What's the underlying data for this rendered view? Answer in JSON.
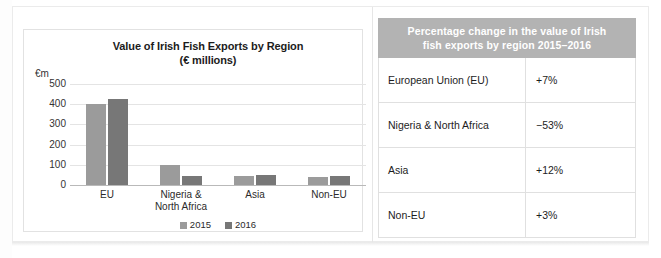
{
  "chart_data": {
    "type": "bar",
    "title": "Value of Irish Fish Exports by Region",
    "subtitle": "(€ millions)",
    "unit_label": "€m",
    "xlabel": "",
    "ylabel": "",
    "ylim": [
      0,
      500
    ],
    "ytick_values": [
      0,
      100,
      200,
      300,
      400,
      500
    ],
    "ytick_labels": [
      "0",
      "100",
      "200",
      "300",
      "400",
      "500"
    ],
    "grid": true,
    "legend_position": "bottom",
    "categories": [
      "EU",
      "Nigeria &\nNorth Africa",
      "Asia",
      "Non-EU"
    ],
    "category_labels": [
      {
        "line1": "EU",
        "line2": ""
      },
      {
        "line1": "Nigeria &",
        "line2": "North Africa"
      },
      {
        "line1": "Asia",
        "line2": ""
      },
      {
        "line1": "Non-EU",
        "line2": ""
      }
    ],
    "series": [
      {
        "name": "2015",
        "color": "#9b9b9b",
        "values": [
          400,
          100,
          47,
          42
        ]
      },
      {
        "name": "2016",
        "color": "#777777",
        "values": [
          428,
          45,
          48,
          44
        ]
      }
    ]
  },
  "table": {
    "header": {
      "line1": "Percentage change in the value of Irish",
      "line2": "fish exports by region 2015–2016",
      "background": "#b3b3b3",
      "text_color": "#ffffff"
    },
    "rows": [
      {
        "region": "European Union (EU)",
        "change": "+7%"
      },
      {
        "region": "Nigeria & North Africa",
        "change": "−53%"
      },
      {
        "region": "Asia",
        "change": "+12%"
      },
      {
        "region": "Non-EU",
        "change": "+3%"
      }
    ]
  }
}
